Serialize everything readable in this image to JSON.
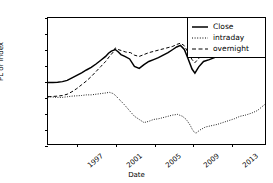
{
  "chart_data": {
    "type": "line",
    "title": "",
    "xlabel": "Date",
    "ylabel": "PL or Index",
    "grid": false,
    "legend_position": "upper right",
    "xlim": [
      1994.0,
      2016.6
    ],
    "ylim": [
      -150,
      250
    ],
    "yticks": [
      250,
      200,
      150,
      100,
      50,
      0,
      -50,
      -100,
      -150
    ],
    "xticks": [
      1997,
      2001,
      2005,
      2009,
      2013
    ],
    "xtick_labels": [
      "1997",
      "2001",
      "2005",
      "2009",
      "2013"
    ],
    "series": [
      {
        "name": "Close",
        "style": "solid",
        "color": "#000000",
        "width": 1.5,
        "x": [
          1994.0,
          1994.5,
          1995.0,
          1995.5,
          1996.0,
          1996.5,
          1997.0,
          1997.5,
          1998.0,
          1998.5,
          1999.0,
          1999.5,
          2000.0,
          2000.3,
          2000.6,
          2001.0,
          2001.3,
          2001.6,
          2002.0,
          2002.5,
          2003.0,
          2003.5,
          2004.0,
          2004.5,
          2005.0,
          2005.5,
          2006.0,
          2006.5,
          2007.0,
          2007.4,
          2007.8,
          2008.2,
          2008.6,
          2009.0,
          2009.3,
          2009.7,
          2010.2,
          2010.8,
          2011.4,
          2012.0,
          2012.6,
          2013.2,
          2013.8,
          2014.4,
          2015.0,
          2015.6,
          2016.0,
          2016.4,
          2016.55
        ],
        "y": [
          45,
          45,
          46,
          48,
          52,
          60,
          68,
          76,
          85,
          93,
          104,
          116,
          128,
          138,
          145,
          150,
          143,
          134,
          128,
          120,
          96,
          90,
          102,
          112,
          118,
          124,
          132,
          140,
          150,
          158,
          163,
          150,
          120,
          88,
          75,
          95,
          112,
          118,
          125,
          130,
          138,
          148,
          158,
          168,
          178,
          190,
          200,
          210,
          215
        ]
      },
      {
        "name": "intraday",
        "style": "dotted",
        "color": "#000000",
        "width": 1.0,
        "x": [
          1994.0,
          1994.5,
          1995.0,
          1995.5,
          1996.0,
          1996.5,
          1997.0,
          1997.5,
          1998.0,
          1998.5,
          1999.0,
          1999.5,
          2000.0,
          2000.4,
          2000.8,
          2001.1,
          2001.4,
          2001.8,
          2002.2,
          2002.6,
          2003.0,
          2003.5,
          2004.0,
          2004.5,
          2005.0,
          2005.5,
          2006.0,
          2006.5,
          2007.0,
          2007.5,
          2008.0,
          2008.4,
          2008.8,
          2009.1,
          2009.4,
          2009.8,
          2010.4,
          2011.0,
          2011.6,
          2012.2,
          2012.8,
          2013.4,
          2014.0,
          2014.6,
          2015.2,
          2015.8,
          2016.2,
          2016.55
        ],
        "y": [
          0,
          -1,
          -2,
          -2,
          0,
          2,
          3,
          4,
          6,
          6,
          8,
          10,
          12,
          14,
          10,
          2,
          -8,
          -20,
          -34,
          -48,
          -62,
          -72,
          -82,
          -78,
          -72,
          -70,
          -66,
          -62,
          -58,
          -56,
          -62,
          -72,
          -90,
          -108,
          -116,
          -106,
          -96,
          -92,
          -88,
          -82,
          -76,
          -70,
          -62,
          -58,
          -52,
          -44,
          -34,
          -25
        ]
      },
      {
        "name": "overnight",
        "style": "dashed",
        "color": "#000000",
        "width": 1.0,
        "x": [
          1994.0,
          1994.5,
          1995.0,
          1995.5,
          1996.0,
          1996.5,
          1997.0,
          1997.5,
          1998.0,
          1998.5,
          1999.0,
          1999.5,
          2000.0,
          2000.4,
          2000.8,
          2001.0,
          2001.3,
          2001.7,
          2002.1,
          2002.6,
          2003.0,
          2003.5,
          2004.0,
          2004.5,
          2005.0,
          2005.5,
          2006.0,
          2006.5,
          2007.0,
          2007.4,
          2007.8,
          2008.2,
          2008.6,
          2009.0,
          2009.3,
          2009.7,
          2010.2,
          2010.8,
          2011.4,
          2012.0,
          2012.6,
          2013.2,
          2013.8,
          2014.4,
          2015.0,
          2015.6,
          2016.0,
          2016.4,
          2016.55
        ],
        "y": [
          0,
          1,
          2,
          4,
          8,
          16,
          26,
          38,
          50,
          64,
          80,
          96,
          112,
          128,
          142,
          155,
          150,
          146,
          142,
          140,
          132,
          128,
          134,
          140,
          144,
          148,
          152,
          156,
          160,
          166,
          170,
          162,
          140,
          118,
          108,
          122,
          135,
          140,
          146,
          150,
          156,
          164,
          172,
          180,
          190,
          200,
          208,
          216,
          220
        ]
      }
    ]
  },
  "legend": {
    "entries": [
      {
        "label": "Close",
        "style": "solid"
      },
      {
        "label": "intraday",
        "style": "dotted"
      },
      {
        "label": "overnight",
        "style": "dashed"
      }
    ]
  }
}
